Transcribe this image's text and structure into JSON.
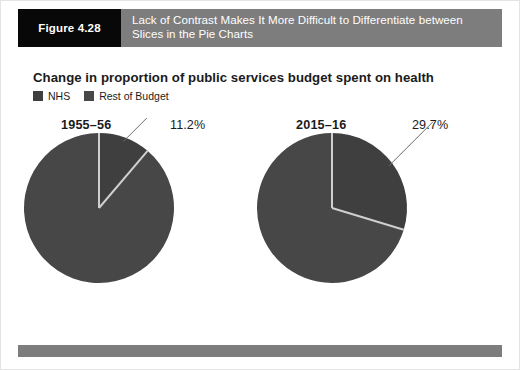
{
  "figure": {
    "tag": "Figure 4.28",
    "caption": "Lack of Contrast Makes It More Difficult to Differentiate between Slices in the Pie Charts"
  },
  "chart_data": {
    "type": "pie",
    "title": "Change in proportion of public services budget spent on health",
    "xlabel": "",
    "ylabel": "",
    "legend": {
      "position": "top-left",
      "entries": [
        {
          "label": "NHS",
          "color": "#3f3f3f"
        },
        {
          "label": "Rest of Budget",
          "color": "#474747"
        }
      ]
    },
    "charts": [
      {
        "period": "1955–56",
        "annotation": "11.2%",
        "categories": [
          "NHS",
          "Rest of Budget"
        ],
        "values": [
          11.2,
          88.8
        ]
      },
      {
        "period": "2015–16",
        "annotation": "29.7%",
        "categories": [
          "NHS",
          "Rest of Budget"
        ],
        "values": [
          29.7,
          70.3
        ]
      }
    ],
    "colors": {
      "nhs_slice": "#3f3f3f",
      "rest_slice": "#474747",
      "slice_divider": "#cfcfcf",
      "header_bar": "#7d7d7d",
      "tag_block": "#080808",
      "text": "#1b1b1b"
    },
    "grid": false
  }
}
